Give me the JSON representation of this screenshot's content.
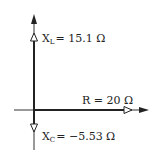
{
  "diagram": {
    "type": "impedance phasor diagram",
    "labels": {
      "xl_symbol": "X",
      "xl_subscript": "L",
      "xl_value": "= 15.1 Ω",
      "r_label": "R = 20 Ω",
      "xc_symbol": "X",
      "xc_subscript": "C",
      "xc_value": "= −5.53 Ω"
    },
    "phasors": [
      {
        "name": "XL",
        "value": 15.1,
        "unit": "Ω",
        "direction": "up"
      },
      {
        "name": "R",
        "value": 20,
        "unit": "Ω",
        "direction": "right"
      },
      {
        "name": "XC",
        "value": -5.53,
        "unit": "Ω",
        "direction": "down"
      }
    ],
    "colors": {
      "line": "#222222",
      "background": "#ffffff"
    }
  }
}
